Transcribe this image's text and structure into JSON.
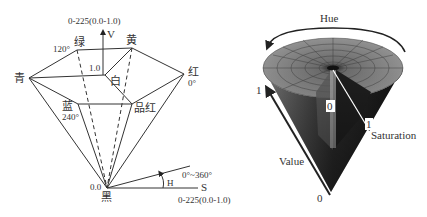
{
  "left_diagram": {
    "title": "HSV hexcone model",
    "v_axis": {
      "range_label": "0-225(0.0-1.0)",
      "axis_label": "V"
    },
    "vertices": {
      "green": {
        "label": "绿",
        "angle": "120°"
      },
      "yellow": {
        "label": "黄"
      },
      "cyan": {
        "label": "青"
      },
      "white": {
        "label": "白",
        "value": "1.0"
      },
      "red": {
        "label": "红",
        "angle": "0°"
      },
      "blue": {
        "label": "蓝",
        "angle": "240°"
      },
      "magenta": {
        "label": "品红"
      },
      "black": {
        "label": "黑",
        "value": "0.0"
      }
    },
    "hue": {
      "label": "H",
      "range": "0°~360°"
    },
    "s_axis": {
      "label": "S",
      "range_label": "0-225(0.0-1.0)"
    }
  },
  "right_diagram": {
    "title": "HSV cone model",
    "hue_label": "Hue",
    "value_label": "Value",
    "value_max": "1",
    "value_min": "0",
    "saturation_label": "Saturation",
    "saturation_min": "0",
    "saturation_max": "1"
  }
}
